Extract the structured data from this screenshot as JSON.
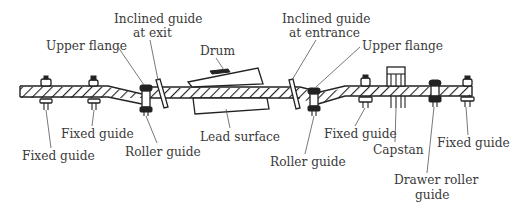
{
  "figure": {
    "type": "tape path schematic",
    "labels": [
      {
        "id": "upper-flange-left",
        "text": "Upper flange",
        "x": 46,
        "y": 50
      },
      {
        "id": "inclined-guide-exit-1",
        "text": "Inclined guide",
        "x": 114,
        "y": 23
      },
      {
        "id": "inclined-guide-exit-2",
        "text": "at exit",
        "x": 133,
        "y": 37
      },
      {
        "id": "drum",
        "text": "Drum",
        "x": 200,
        "y": 55
      },
      {
        "id": "inclined-guide-entrance-1",
        "text": "Inclined guide",
        "x": 282,
        "y": 23
      },
      {
        "id": "inclined-guide-entrance-2",
        "text": "at entrance",
        "x": 289,
        "y": 37
      },
      {
        "id": "upper-flange-right",
        "text": "Upper flange",
        "x": 362,
        "y": 50
      },
      {
        "id": "fixed-guide-1",
        "text": "Fixed guide",
        "x": 22,
        "y": 160
      },
      {
        "id": "fixed-guide-2",
        "text": "Fixed guide",
        "x": 61,
        "y": 138
      },
      {
        "id": "roller-guide-left",
        "text": "Roller guide",
        "x": 125,
        "y": 156
      },
      {
        "id": "lead-surface",
        "text": "Lead surface",
        "x": 200,
        "y": 141
      },
      {
        "id": "roller-guide-right",
        "text": "Roller guide",
        "x": 270,
        "y": 166
      },
      {
        "id": "fixed-guide-3",
        "text": "Fixed guide",
        "x": 324,
        "y": 138
      },
      {
        "id": "capstan",
        "text": "Capstan",
        "x": 373,
        "y": 154
      },
      {
        "id": "fixed-guide-4",
        "text": "Fixed guide",
        "x": 437,
        "y": 147
      },
      {
        "id": "drawer-roller-guide-1",
        "text": "Drawer roller",
        "x": 394,
        "y": 184
      },
      {
        "id": "drawer-roller-guide-2",
        "text": "guide",
        "x": 415,
        "y": 199
      }
    ]
  }
}
